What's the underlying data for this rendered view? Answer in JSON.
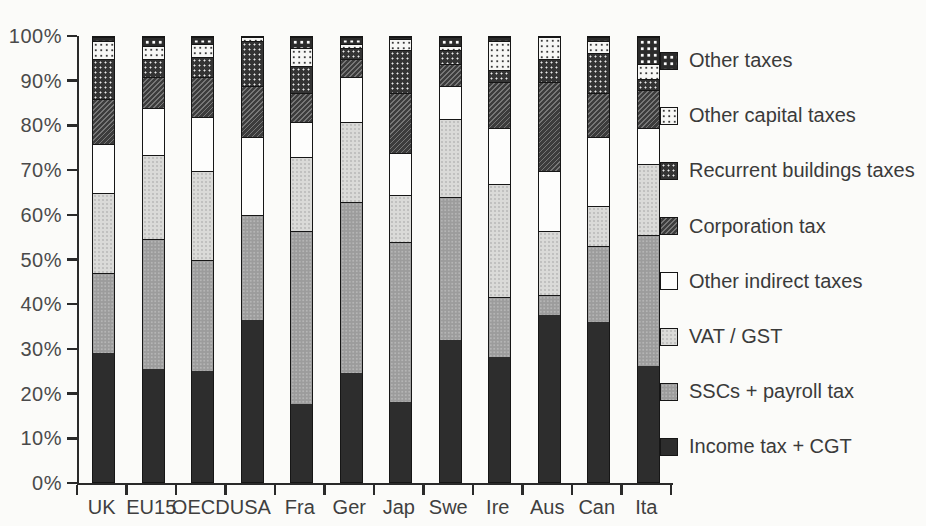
{
  "chart_data": {
    "type": "bar",
    "stacked": true,
    "percent_stacked": true,
    "unit": "%",
    "title": "",
    "xlabel": "",
    "ylabel": "",
    "grid": false,
    "legend_position": "right",
    "categories": [
      "UK",
      "EU15",
      "OECD",
      "USA",
      "Fra",
      "Ger",
      "Jap",
      "Swe",
      "Ire",
      "Aus",
      "Can",
      "Ita"
    ],
    "series": [
      {
        "key": "income",
        "name": "Income tax + CGT",
        "values": [
          29,
          25.5,
          25,
          36.5,
          17.5,
          24.5,
          18,
          32,
          28,
          37.5,
          36,
          26
        ]
      },
      {
        "key": "ssc",
        "name": "SSCs + payroll tax",
        "values": [
          18,
          29,
          25,
          23.5,
          39,
          38.5,
          36,
          32,
          13.5,
          4.5,
          17,
          29.5
        ]
      },
      {
        "key": "vat",
        "name": "VAT / GST",
        "values": [
          18,
          19,
          20,
          0,
          16.5,
          18,
          10.5,
          17.5,
          25.5,
          14.5,
          9,
          16
        ]
      },
      {
        "key": "other_indirect",
        "name": "Other indirect taxes",
        "values": [
          11,
          10.5,
          12,
          17.5,
          8,
          10,
          9.5,
          7.5,
          12.5,
          13.5,
          15.5,
          8
        ]
      },
      {
        "key": "corporation",
        "name": "Corporation tax",
        "values": [
          10,
          7,
          9,
          11.5,
          6.5,
          4,
          13.5,
          5,
          10.5,
          20,
          10,
          8.5
        ]
      },
      {
        "key": "recurrent_buildings",
        "name": "Recurrent buildings taxes",
        "values": [
          9,
          4,
          4.5,
          10,
          6,
          2.5,
          9.5,
          3,
          2.5,
          5,
          9,
          2.5
        ]
      },
      {
        "key": "other_capital",
        "name": "Other capital taxes",
        "values": [
          4,
          3,
          3,
          1,
          4,
          1,
          2.5,
          1,
          6.5,
          5,
          2.5,
          3.5
        ]
      },
      {
        "key": "other",
        "name": "Other taxes",
        "values": [
          1,
          2,
          1.5,
          0,
          2.5,
          1.5,
          0.5,
          2,
          1,
          0,
          1,
          6
        ]
      }
    ],
    "y_axis": {
      "min": 0,
      "max": 100,
      "tick_step": 10,
      "tick_labels": [
        "0%",
        "10%",
        "20%",
        "30%",
        "40%",
        "50%",
        "60%",
        "70%",
        "80%",
        "90%",
        "100%"
      ]
    },
    "legend_order_top_to_bottom": [
      "other",
      "other_capital",
      "recurrent_buildings",
      "corporation",
      "other_indirect",
      "vat",
      "ssc",
      "income"
    ]
  },
  "colors": {
    "income": "#2d2d2d",
    "ssc": "#9c9c9c",
    "vat": "#dadad8",
    "other_indirect": "#fdfdfc",
    "corporation": "#3c3c3c",
    "recurrent_buildings": "#343434",
    "other_capital": "#f7f7f5",
    "other": "#2b2b2b",
    "axis": "#2a2a2a",
    "text": "#3f3f3f",
    "background": "#fbfbf9"
  }
}
